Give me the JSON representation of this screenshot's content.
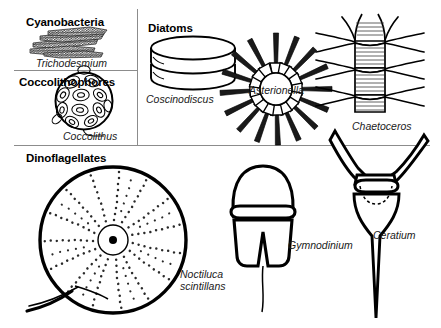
{
  "figure": {
    "background_color": "#ffffff",
    "ink_color": "#000000",
    "rule_color": "#8c8c8c"
  },
  "groups": [
    {
      "id": "cyanobacteria",
      "label": "Cyanobacteria"
    },
    {
      "id": "coccolithophores",
      "label": "Coccolithophores"
    },
    {
      "id": "diatoms",
      "label": "Diatoms"
    },
    {
      "id": "dinoflagellates",
      "label": "Dinoflagellates"
    }
  ],
  "organisms": [
    {
      "id": "trichodesmium",
      "label": "Trichodesmium",
      "group": "cyanobacteria",
      "shape": "filament-bundle"
    },
    {
      "id": "coccolithus",
      "label": "Coccolithus",
      "group": "coccolithophores",
      "shape": "plated-sphere"
    },
    {
      "id": "coscinodiscus",
      "label": "Coscinodiscus",
      "group": "diatoms",
      "shape": "drum-cylinder"
    },
    {
      "id": "asterionella",
      "label": "Asterionella",
      "group": "diatoms",
      "shape": "radiating-star-colony"
    },
    {
      "id": "chaetoceros",
      "label": "Chaetoceros",
      "group": "diatoms",
      "shape": "spined-cell-chain"
    },
    {
      "id": "noctiluca",
      "label": "Noctiluca",
      "label_line2": "scintillans",
      "group": "dinoflagellates",
      "shape": "large-dotted-sphere-with-tentacle"
    },
    {
      "id": "gymnodinium",
      "label": "Gymnodinium",
      "group": "dinoflagellates",
      "shape": "helmet-with-girdle-and-flagellum"
    },
    {
      "id": "ceratium",
      "label": "Ceratium",
      "group": "dinoflagellates",
      "shape": "horned-anchor-with-apical-spine"
    }
  ]
}
